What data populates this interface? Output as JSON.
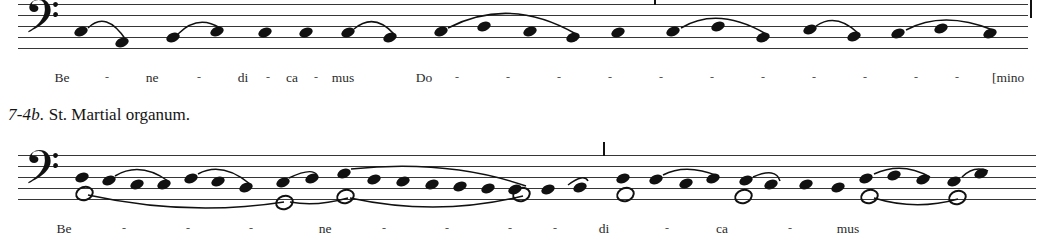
{
  "figure": {
    "caption_number": "7-4b.",
    "caption_text": "St. Martial organum."
  },
  "systems": [
    {
      "id": "system-1",
      "clef": "bass-clef",
      "clef_glyph": "𝄢",
      "lyrics": [
        {
          "text": "Be",
          "x": 62
        },
        {
          "text": "-",
          "x": 107
        },
        {
          "text": "ne",
          "x": 152
        },
        {
          "text": "-",
          "x": 199
        },
        {
          "text": "di",
          "x": 243
        },
        {
          "text": "-",
          "x": 268
        },
        {
          "text": "ca",
          "x": 292
        },
        {
          "text": "-",
          "x": 316
        },
        {
          "text": "mus",
          "x": 343
        },
        {
          "text": "Do",
          "x": 424
        },
        {
          "text": "-",
          "x": 457
        },
        {
          "text": "-",
          "x": 508
        },
        {
          "text": "-",
          "x": 559
        },
        {
          "text": "-",
          "x": 610
        },
        {
          "text": "-",
          "x": 661
        },
        {
          "text": "-",
          "x": 712
        },
        {
          "text": "-",
          "x": 763
        },
        {
          "text": "-",
          "x": 814
        },
        {
          "text": "-",
          "x": 865
        },
        {
          "text": "-",
          "x": 916
        },
        {
          "text": "-",
          "x": 957
        },
        {
          "text": "[mino",
          "x": 992
        }
      ],
      "voices": [
        {
          "name": "upper-voice",
          "notehead": "filled",
          "notes": [
            {
              "x": 63,
              "y": 27
            },
            {
              "x": 104,
              "y": 38
            },
            {
              "x": 155,
              "y": 33
            },
            {
              "x": 199,
              "y": 27
            },
            {
              "x": 247,
              "y": 28
            },
            {
              "x": 288,
              "y": 28
            },
            {
              "x": 330,
              "y": 28
            },
            {
              "x": 372,
              "y": 33
            },
            {
              "x": 423,
              "y": 27
            },
            {
              "x": 466,
              "y": 22
            },
            {
              "x": 512,
              "y": 27
            },
            {
              "x": 555,
              "y": 33
            },
            {
              "x": 600,
              "y": 28
            },
            {
              "x": 655,
              "y": 27
            },
            {
              "x": 700,
              "y": 22
            },
            {
              "x": 745,
              "y": 33
            },
            {
              "x": 792,
              "y": 25
            },
            {
              "x": 836,
              "y": 32
            },
            {
              "x": 880,
              "y": 29
            },
            {
              "x": 923,
              "y": 24
            },
            {
              "x": 972,
              "y": 29
            }
          ]
        }
      ],
      "slurs": [
        {
          "x1": 70,
          "y1": 24,
          "cx": 88,
          "cy": 6,
          "x2": 108,
          "y2": 36
        },
        {
          "x1": 160,
          "y1": 30,
          "cx": 180,
          "cy": 10,
          "x2": 202,
          "y2": 24
        },
        {
          "x1": 336,
          "y1": 25,
          "cx": 356,
          "cy": 8,
          "x2": 376,
          "y2": 30
        },
        {
          "x1": 430,
          "y1": 24,
          "cx": 492,
          "cy": -8,
          "x2": 558,
          "y2": 30
        },
        {
          "x1": 663,
          "y1": 24,
          "cx": 700,
          "cy": 2,
          "x2": 748,
          "y2": 30
        },
        {
          "x1": 798,
          "y1": 22,
          "cx": 818,
          "cy": 8,
          "x2": 840,
          "y2": 29
        },
        {
          "x1": 888,
          "y1": 26,
          "cx": 925,
          "cy": 6,
          "x2": 975,
          "y2": 26
        }
      ],
      "barlines": [
        {
          "type": "tick",
          "x": 636
        },
        {
          "type": "final",
          "x": 1012
        }
      ]
    },
    {
      "id": "system-2",
      "clef": "bass-clef",
      "clef_glyph": "𝄢",
      "lyrics": [
        {
          "text": "Be",
          "x": 64
        },
        {
          "text": "-",
          "x": 124
        },
        {
          "text": "-",
          "x": 188
        },
        {
          "text": "-",
          "x": 251
        },
        {
          "text": "ne",
          "x": 325
        },
        {
          "text": "-",
          "x": 384
        },
        {
          "text": "-",
          "x": 447
        },
        {
          "text": "-",
          "x": 510
        },
        {
          "text": "-",
          "x": 555
        },
        {
          "text": "di",
          "x": 604
        },
        {
          "text": "-",
          "x": 667
        },
        {
          "text": "ca",
          "x": 722
        },
        {
          "text": "-",
          "x": 790
        },
        {
          "text": "mus",
          "x": 848
        }
      ],
      "voices": [
        {
          "name": "upper-voice",
          "notehead": "filled",
          "notes": [
            {
              "x": 64,
              "y": 22
            },
            {
              "x": 91,
              "y": 25
            },
            {
              "x": 119,
              "y": 29
            },
            {
              "x": 146,
              "y": 29
            },
            {
              "x": 173,
              "y": 23
            },
            {
              "x": 200,
              "y": 26
            },
            {
              "x": 228,
              "y": 32
            },
            {
              "x": 265,
              "y": 27
            },
            {
              "x": 294,
              "y": 23
            },
            {
              "x": 326,
              "y": 18
            },
            {
              "x": 356,
              "y": 24
            },
            {
              "x": 385,
              "y": 26
            },
            {
              "x": 414,
              "y": 29
            },
            {
              "x": 442,
              "y": 31
            },
            {
              "x": 470,
              "y": 33
            },
            {
              "x": 497,
              "y": 34
            },
            {
              "x": 530,
              "y": 34
            },
            {
              "x": 562,
              "y": 32
            },
            {
              "x": 605,
              "y": 23
            },
            {
              "x": 638,
              "y": 24
            },
            {
              "x": 668,
              "y": 28
            },
            {
              "x": 695,
              "y": 23
            },
            {
              "x": 728,
              "y": 25
            },
            {
              "x": 753,
              "y": 29
            },
            {
              "x": 788,
              "y": 29
            },
            {
              "x": 820,
              "y": 32
            },
            {
              "x": 848,
              "y": 23
            },
            {
              "x": 876,
              "y": 20
            },
            {
              "x": 905,
              "y": 24
            },
            {
              "x": 936,
              "y": 26
            },
            {
              "x": 963,
              "y": 18
            }
          ]
        },
        {
          "name": "lower-voice",
          "notehead": "open",
          "notes": [
            {
              "x": 64,
              "y": 35
            },
            {
              "x": 264,
              "y": 44
            },
            {
              "x": 325,
              "y": 38
            },
            {
              "x": 501,
              "y": 36
            },
            {
              "x": 605,
              "y": 36
            },
            {
              "x": 723,
              "y": 38
            },
            {
              "x": 849,
              "y": 38
            },
            {
              "x": 937,
              "y": 39
            }
          ]
        }
      ],
      "slurs": [
        {
          "x1": 97,
          "y1": 21,
          "cx": 122,
          "cy": 6,
          "x2": 150,
          "y2": 26
        },
        {
          "x1": 180,
          "y1": 19,
          "cx": 204,
          "cy": 6,
          "x2": 232,
          "y2": 29
        },
        {
          "x1": 271,
          "y1": 23,
          "cx": 294,
          "cy": 12,
          "x2": 299,
          "y2": 20
        },
        {
          "x1": 333,
          "y1": 14,
          "cx": 430,
          "cy": 4,
          "x2": 508,
          "y2": 31
        },
        {
          "x1": 550,
          "y1": 30,
          "cx": 566,
          "cy": 18,
          "x2": 570,
          "y2": 26
        },
        {
          "x1": 645,
          "y1": 20,
          "cx": 668,
          "cy": 8,
          "x2": 700,
          "y2": 21
        },
        {
          "x1": 735,
          "y1": 22,
          "cx": 758,
          "cy": 12,
          "x2": 762,
          "y2": 26
        },
        {
          "x1": 856,
          "y1": 19,
          "cx": 884,
          "cy": 6,
          "x2": 912,
          "y2": 22
        },
        {
          "x1": 944,
          "y1": 22,
          "cx": 956,
          "cy": 10,
          "x2": 970,
          "y2": 16
        }
      ],
      "lower_slurs": [
        {
          "x1": 70,
          "y1": 40,
          "cx": 170,
          "cy": 62,
          "x2": 266,
          "y2": 47
        },
        {
          "x1": 272,
          "y1": 47,
          "cx": 298,
          "cy": 52,
          "x2": 330,
          "y2": 43
        },
        {
          "x1": 332,
          "y1": 43,
          "cx": 420,
          "cy": 62,
          "x2": 505,
          "y2": 41
        },
        {
          "x1": 856,
          "y1": 43,
          "cx": 898,
          "cy": 56,
          "x2": 940,
          "y2": 44
        }
      ],
      "barlines": [
        {
          "type": "tick",
          "x": 585
        }
      ]
    }
  ]
}
